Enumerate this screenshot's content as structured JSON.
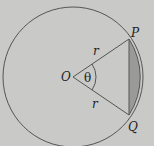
{
  "diagram": {
    "type": "circle-segment",
    "labels": {
      "center": "O",
      "angle": "θ",
      "point_top": "P",
      "point_bottom": "Q",
      "radius_top": "r",
      "radius_bottom": "r"
    },
    "colors": {
      "background": "#c9c9c7",
      "stroke": "#555555",
      "segment_fill": "#9a9a98"
    },
    "geometry": {
      "center": [
        73,
        77
      ],
      "radius": 70,
      "P": [
        129,
        39
      ],
      "Q": [
        129,
        115
      ]
    }
  }
}
